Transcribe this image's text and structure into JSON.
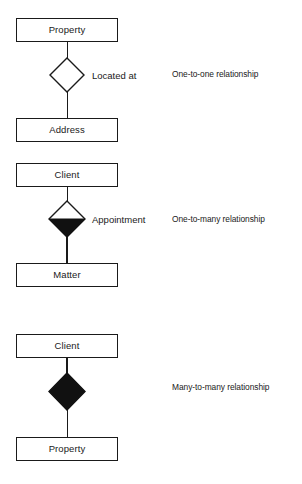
{
  "diagram": {
    "background_color": "#ffffff",
    "line_color": "#1a1a1a",
    "fill_color": "#111111",
    "groups": [
      {
        "id": "one-to-one",
        "top_entity": "Property",
        "bottom_entity": "Address",
        "relationship_name": "Located at",
        "caption": "One-to-one relationship",
        "diamond_style": "hollow"
      },
      {
        "id": "one-to-many",
        "top_entity": "Client",
        "bottom_entity": "Matter",
        "relationship_name": "Appointment",
        "caption": "One-to-many relationship",
        "diamond_style": "half-filled-bottom"
      },
      {
        "id": "many-to-many",
        "top_entity": "Client",
        "bottom_entity": "Property",
        "relationship_name": "",
        "caption": "Many-to-many relationship",
        "diamond_style": "filled"
      }
    ]
  }
}
